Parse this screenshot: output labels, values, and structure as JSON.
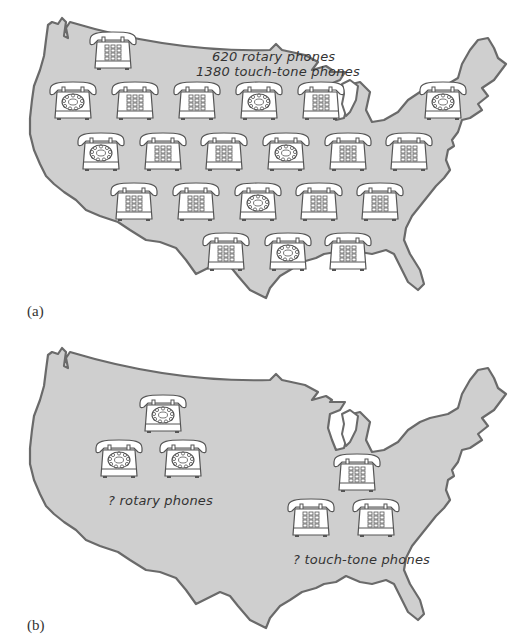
{
  "figure": {
    "panel_a": {
      "label": "(a)",
      "caption_line1": "620 rotary phones",
      "caption_line2": "1380 touch-tone phones",
      "phones": [
        {
          "type": "touch",
          "x": 86,
          "y": 30
        },
        {
          "type": "rotary",
          "x": 46,
          "y": 80
        },
        {
          "type": "touch",
          "x": 108,
          "y": 80
        },
        {
          "type": "touch",
          "x": 170,
          "y": 80
        },
        {
          "type": "rotary",
          "x": 232,
          "y": 80
        },
        {
          "type": "touch",
          "x": 294,
          "y": 80
        },
        {
          "type": "rotary",
          "x": 416,
          "y": 80
        },
        {
          "type": "rotary",
          "x": 74,
          "y": 131
        },
        {
          "type": "touch",
          "x": 136,
          "y": 131
        },
        {
          "type": "touch",
          "x": 197,
          "y": 131
        },
        {
          "type": "rotary",
          "x": 259,
          "y": 131
        },
        {
          "type": "touch",
          "x": 321,
          "y": 131
        },
        {
          "type": "touch",
          "x": 382,
          "y": 131
        },
        {
          "type": "touch",
          "x": 107,
          "y": 181
        },
        {
          "type": "touch",
          "x": 169,
          "y": 181
        },
        {
          "type": "rotary",
          "x": 231,
          "y": 181
        },
        {
          "type": "touch",
          "x": 292,
          "y": 181
        },
        {
          "type": "touch",
          "x": 353,
          "y": 181
        },
        {
          "type": "touch",
          "x": 199,
          "y": 231
        },
        {
          "type": "rotary",
          "x": 261,
          "y": 231
        },
        {
          "type": "touch",
          "x": 321,
          "y": 231
        }
      ]
    },
    "panel_b": {
      "label": "(b)",
      "rotary_caption": "? rotary phones",
      "touch_caption": "? touch-tone phones",
      "phones": [
        {
          "type": "rotary",
          "x": 136,
          "y": 103
        },
        {
          "type": "rotary",
          "x": 92,
          "y": 148
        },
        {
          "type": "rotary",
          "x": 156,
          "y": 148
        },
        {
          "type": "touch",
          "x": 330,
          "y": 162
        },
        {
          "type": "touch",
          "x": 284,
          "y": 207
        },
        {
          "type": "touch",
          "x": 349,
          "y": 207
        }
      ]
    },
    "colors": {
      "map_fill": "#cfcfcf",
      "map_outline": "#6a6a6a",
      "phone_outline": "#555555",
      "phone_fill": "#ffffff"
    }
  }
}
